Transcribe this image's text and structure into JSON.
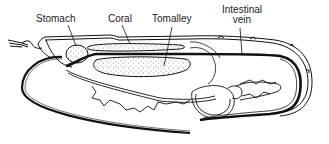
{
  "diagram": {
    "colors": {
      "ink": "#111111",
      "background": "#ffffff",
      "label": "#1a1a1a"
    },
    "labels": [
      {
        "id": "stomach",
        "text": "Stomach"
      },
      {
        "id": "coral",
        "text": "Coral"
      },
      {
        "id": "tomalley",
        "text": "Tomalley"
      },
      {
        "id": "intestinal_vein",
        "line1": "Intestinal",
        "line2": "vein"
      }
    ]
  }
}
